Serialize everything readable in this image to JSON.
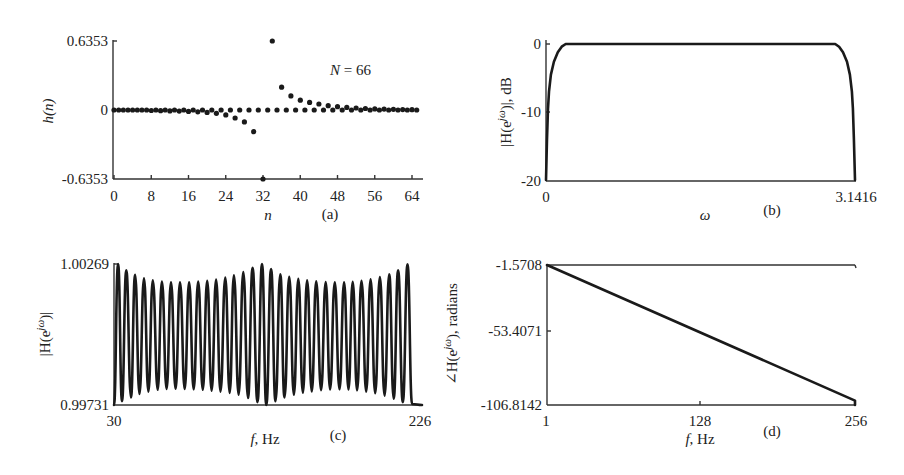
{
  "figure": {
    "background": "#ffffff",
    "ink_color": "#1a1a1a"
  },
  "chart_data": [
    {
      "id": "a",
      "type": "scatter",
      "panel_label": "(a)",
      "title": "",
      "annotation": "N = 66",
      "xlabel": "n",
      "ylabel": "h(n)",
      "xlim": [
        0,
        65
      ],
      "ylim": [
        -0.6353,
        0.6353
      ],
      "xticks": [
        0,
        8,
        16,
        24,
        32,
        40,
        48,
        56,
        64
      ],
      "yticks": [
        -0.6353,
        0,
        0.6353
      ],
      "ytick_labels": [
        "-0.6353",
        "0",
        "0.6353"
      ],
      "grid": false,
      "x": [
        0,
        1,
        2,
        3,
        4,
        5,
        6,
        7,
        8,
        9,
        10,
        11,
        12,
        13,
        14,
        15,
        16,
        17,
        18,
        19,
        20,
        21,
        22,
        23,
        24,
        25,
        26,
        27,
        28,
        29,
        30,
        31,
        32,
        33,
        34,
        35,
        36,
        37,
        38,
        39,
        40,
        41,
        42,
        43,
        44,
        45,
        46,
        47,
        48,
        49,
        50,
        51,
        52,
        53,
        54,
        55,
        56,
        57,
        58,
        59,
        60,
        61,
        62,
        63,
        64,
        65
      ],
      "y": [
        0,
        0,
        0,
        0,
        0,
        0,
        0,
        0,
        -0.005,
        0,
        -0.006,
        0,
        -0.008,
        0,
        -0.01,
        0,
        -0.013,
        0,
        -0.017,
        0,
        -0.022,
        0,
        -0.03,
        0,
        -0.045,
        0,
        -0.074,
        0,
        -0.11,
        0,
        -0.2,
        0,
        -0.6353,
        0,
        0.6353,
        0,
        0.21,
        0,
        0.13,
        0,
        0.09,
        0,
        0.07,
        0,
        0.055,
        0,
        0.04,
        0,
        0.03,
        0,
        0.024,
        0,
        0.018,
        0,
        0.014,
        0,
        0.01,
        0,
        0.008,
        0,
        0.006,
        0,
        0.004,
        0,
        0.003,
        0
      ]
    },
    {
      "id": "b",
      "type": "line",
      "panel_label": "(b)",
      "title": "",
      "xlabel": "ω",
      "ylabel": "|H(e^jω)|, dB",
      "xlim": [
        0,
        3.1416
      ],
      "ylim": [
        -20,
        0
      ],
      "xticks": [
        0,
        3.1416
      ],
      "xtick_labels": [
        "0",
        "3.1416"
      ],
      "yticks": [
        -20,
        -10,
        0
      ],
      "ytick_labels": [
        "-20",
        "-10",
        "0"
      ],
      "grid": false,
      "x": [
        0,
        0.01,
        0.02,
        0.03,
        0.05,
        0.08,
        0.12,
        0.16,
        0.2,
        1.0,
        2.0,
        2.94,
        2.98,
        3.02,
        3.06,
        3.09,
        3.11,
        3.12,
        3.13,
        3.1416
      ],
      "y": [
        -20,
        -14,
        -9.5,
        -7,
        -4.5,
        -2.6,
        -1.2,
        -0.4,
        0,
        0,
        0,
        0,
        -0.4,
        -1.2,
        -2.6,
        -4.5,
        -7,
        -9.5,
        -14,
        -20
      ]
    },
    {
      "id": "c",
      "type": "line",
      "panel_label": "(c)",
      "title": "",
      "xlabel": "f, Hz",
      "ylabel": "|H(e^jω)|",
      "xlim": [
        30,
        226
      ],
      "ylim": [
        0.99731,
        1.00269
      ],
      "xticks": [
        30,
        226
      ],
      "xtick_labels": [
        "30",
        "226"
      ],
      "yticks": [
        0.99731,
        1.00269
      ],
      "ytick_labels": [
        "0.99731",
        "1.00269"
      ],
      "grid": false,
      "x": [
        30,
        32.6,
        35.1,
        37.8,
        40.8,
        43.4,
        46.2,
        49.1,
        51.9,
        54.7,
        57.8,
        60.5,
        63.5,
        66.3,
        69.2,
        72.0,
        75.0,
        77.8,
        80.7,
        83.6,
        86.5,
        89.3,
        92.1,
        95.0,
        97.8,
        100.8,
        103.6,
        106.3,
        109.3,
        112.3,
        115.3,
        118.2,
        121.3,
        124.2,
        126.9,
        130.0,
        132.8,
        135.8,
        138.5,
        141.5,
        144.5,
        147.3,
        150.2,
        152.9,
        155.9,
        158.7,
        161.8,
        164.7,
        167.5,
        170.5,
        173.5,
        176.4,
        179.2,
        181.9,
        184.7,
        187.5,
        190.5,
        193.3,
        196.2,
        199.2,
        202.2,
        205.1,
        208.0,
        210.8,
        213.8,
        216.8,
        219.7,
        226
      ],
      "y": [
        0.99731,
        1.00269,
        0.99745,
        1.00245,
        0.9976,
        1.00228,
        0.99773,
        1.00215,
        0.99782,
        1.00207,
        0.99789,
        1.00202,
        0.99792,
        1.00199,
        0.99793,
        1.00199,
        0.99792,
        1.00199,
        0.99791,
        1.00202,
        0.99789,
        1.00205,
        0.99786,
        1.0021,
        0.99782,
        1.00217,
        0.99777,
        1.00226,
        0.9977,
        1.00238,
        0.99758,
        1.00255,
        0.99742,
        1.00269,
        0.99731,
        1.0025,
        0.99745,
        1.0023,
        0.9976,
        1.0022,
        0.9977,
        1.00212,
        0.99778,
        1.00207,
        0.99783,
        1.00203,
        0.99788,
        1.002,
        0.9979,
        1.00199,
        0.99791,
        1.00199,
        0.9979,
        1.00201,
        0.99787,
        1.00205,
        0.99782,
        1.00211,
        0.99776,
        1.00219,
        0.99767,
        1.0023,
        0.99755,
        1.00245,
        0.99742,
        1.00268,
        0.99735,
        0.99731
      ]
    },
    {
      "id": "d",
      "type": "line",
      "panel_label": "(d)",
      "title": "",
      "xlabel": "f, Hz",
      "ylabel": "∠H(e^jω), radians",
      "xlim": [
        1,
        256
      ],
      "ylim": [
        -106.8142,
        -1.5708
      ],
      "xticks": [
        1,
        128,
        256
      ],
      "xtick_labels": [
        "1",
        "128",
        "256"
      ],
      "yticks": [
        -106.8142,
        -53.4071,
        -1.5708
      ],
      "ytick_labels": [
        "-106.8142",
        "-53.4071",
        "-1.5708"
      ],
      "grid": false,
      "x": [
        1,
        256,
        256
      ],
      "y": [
        -1.5708,
        -103.5,
        -106.8142
      ]
    }
  ],
  "panels": {
    "a": {
      "ylabel_main": "h(n)",
      "xlabel": "n",
      "panel_label": "(a)",
      "annotation_N": "N",
      "annotation_eq": " = 66",
      "ytick_top": "0.6353",
      "ytick_mid": "0",
      "ytick_bot": "-0.6353",
      "xticks": [
        "0",
        "8",
        "16",
        "24",
        "32",
        "40",
        "48",
        "56",
        "64"
      ]
    },
    "b": {
      "ylabel_pre": "|H(e",
      "ylabel_sup": "jω",
      "ylabel_post": ")|, dB",
      "xlabel": "ω",
      "panel_label": "(b)",
      "ytick_top": "0",
      "ytick_mid": "-10",
      "ytick_bot": "-20",
      "xtick_left": "0",
      "xtick_right": "3.1416"
    },
    "c": {
      "ylabel_pre": "|H(e",
      "ylabel_sup": "jω",
      "ylabel_post": ")|",
      "xlabel_f": "f",
      "xlabel_unit": ", Hz",
      "panel_label": "(c)",
      "ytick_top": "1.00269",
      "ytick_bot": "0.99731",
      "xtick_left": "30",
      "xtick_right": "226"
    },
    "d": {
      "ylabel_pre": "∠H(e",
      "ylabel_sup": "jω",
      "ylabel_post": "), radians",
      "xlabel_f": "f",
      "xlabel_unit": ", Hz",
      "panel_label": "(d)",
      "ytick_top": "-1.5708",
      "ytick_mid": "-53.4071",
      "ytick_bot": "-106.8142",
      "xtick_left": "1",
      "xtick_mid": "128",
      "xtick_right": "256"
    }
  }
}
